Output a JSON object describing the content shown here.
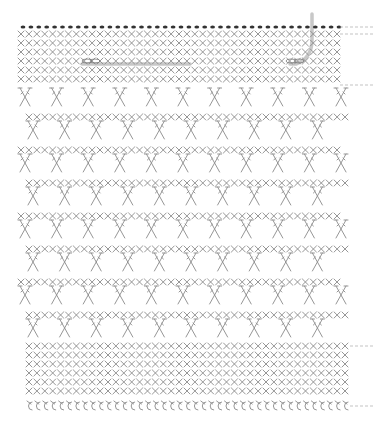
{
  "diagram": {
    "type": "crochet-stitch-chart",
    "colors": {
      "stitch": "#8a8a8a",
      "dot": "#333333",
      "yarn_path": "#c8c8c8",
      "guide_line": "#b4b4b4"
    },
    "stitch_symbols": {
      "dot": "slip-stitch",
      "x": "single-crochet",
      "crossed": "crossed-double-crochet",
      "chain": "chain-stitch"
    },
    "grid": {
      "x_start": 21,
      "x_step": 15.8,
      "columns": 21
    },
    "rows": [
      {
        "kind": "dot",
        "y": 27,
        "offset": 0
      },
      {
        "kind": "x",
        "y": 34,
        "offset": 0
      },
      {
        "kind": "x",
        "y": 43,
        "offset": 0
      },
      {
        "kind": "x",
        "y": 52,
        "offset": 0
      },
      {
        "kind": "x",
        "y": 61,
        "offset": 0
      },
      {
        "kind": "x",
        "y": 70,
        "offset": 0
      },
      {
        "kind": "x",
        "y": 79,
        "offset": 0
      },
      {
        "kind": "crossed",
        "y": 88,
        "offset": 0,
        "count": 10
      },
      {
        "kind": "x",
        "y": 117,
        "offset": 10
      },
      {
        "kind": "crossed",
        "y": 121,
        "offset": 10,
        "count": 10
      },
      {
        "kind": "x",
        "y": 150,
        "offset": 0
      },
      {
        "kind": "crossed",
        "y": 154,
        "offset": 0,
        "count": 10
      },
      {
        "kind": "x",
        "y": 183,
        "offset": 10
      },
      {
        "kind": "crossed",
        "y": 187,
        "offset": 10,
        "count": 10
      },
      {
        "kind": "x",
        "y": 216,
        "offset": 0
      },
      {
        "kind": "crossed",
        "y": 220,
        "offset": 0,
        "count": 10
      },
      {
        "kind": "x",
        "y": 249,
        "offset": 10
      },
      {
        "kind": "crossed",
        "y": 253,
        "offset": 10,
        "count": 10
      },
      {
        "kind": "x",
        "y": 282,
        "offset": 0
      },
      {
        "kind": "crossed",
        "y": 286,
        "offset": 0,
        "count": 10
      },
      {
        "kind": "x",
        "y": 315,
        "offset": 10
      },
      {
        "kind": "crossed",
        "y": 319,
        "offset": 10,
        "count": 10
      },
      {
        "kind": "x",
        "y": 346,
        "offset": 10
      },
      {
        "kind": "x",
        "y": 355,
        "offset": 10
      },
      {
        "kind": "x",
        "y": 364,
        "offset": 10
      },
      {
        "kind": "x",
        "y": 373,
        "offset": 10
      },
      {
        "kind": "x",
        "y": 382,
        "offset": 10
      },
      {
        "kind": "x",
        "y": 391,
        "offset": 10
      },
      {
        "kind": "chain",
        "y": 406,
        "offset": 10
      }
    ],
    "guide_lines": [
      {
        "y": 27,
        "x1": 340,
        "x2": 373
      },
      {
        "y": 34,
        "x1": 340,
        "x2": 373
      },
      {
        "y": 85,
        "x1": 340,
        "x2": 373
      },
      {
        "y": 346,
        "x1": 350,
        "x2": 373
      },
      {
        "y": 406,
        "x1": 350,
        "x2": 373
      }
    ],
    "yarn_paths": [
      {
        "name": "horizontal-yarn",
        "d": "M82 64 L190 64"
      },
      {
        "name": "corner-yarn",
        "d": "M312 14 L312 40 Q312 58 296 64 L290 64"
      }
    ],
    "loops": [
      {
        "name": "left-chain-loop",
        "cx": 90,
        "cy": 61
      },
      {
        "name": "right-chain-loop",
        "cx": 294,
        "cy": 61
      }
    ]
  }
}
